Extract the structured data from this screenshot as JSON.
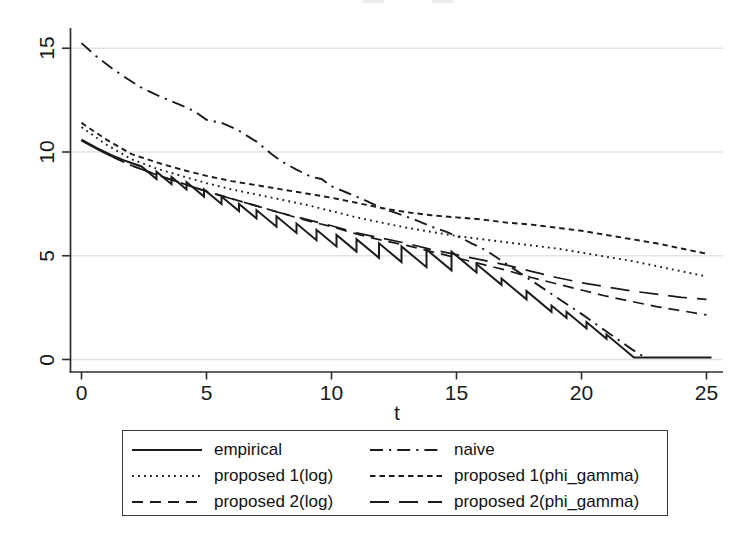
{
  "colors": {
    "line": "#1b1b1b",
    "grid": "#e3e3e3",
    "axis": "#2e2e2e",
    "text": "#1a1a1a",
    "legend_border": "#3a3a3a",
    "background": "#ffffff"
  },
  "chart_data": {
    "type": "line",
    "title": "",
    "xlabel": "t",
    "ylabel": "",
    "xlim": [
      0,
      25.2
    ],
    "ylim": [
      0,
      15.5
    ],
    "x_ticks": [
      0,
      5,
      10,
      15,
      20,
      25
    ],
    "y_ticks": [
      0,
      5,
      10,
      15
    ],
    "grid": "horizontal-only",
    "series": [
      {
        "id": "empirical",
        "name": "empirical",
        "style": "solid",
        "points": [
          [
            0,
            10.6
          ],
          [
            0.6,
            10.2
          ],
          [
            1.2,
            9.85
          ],
          [
            1.8,
            9.55
          ],
          [
            2.4,
            9.3
          ],
          [
            3.0,
            8.7
          ],
          [
            3.0,
            9.05
          ],
          [
            3.6,
            8.45
          ],
          [
            3.6,
            8.8
          ],
          [
            4.2,
            8.2
          ],
          [
            4.2,
            8.55
          ],
          [
            4.9,
            7.85
          ],
          [
            4.9,
            8.2
          ],
          [
            5.6,
            7.5
          ],
          [
            5.6,
            7.85
          ],
          [
            6.3,
            7.15
          ],
          [
            6.3,
            7.5
          ],
          [
            7.0,
            6.8
          ],
          [
            7.0,
            7.2
          ],
          [
            7.8,
            6.4
          ],
          [
            7.8,
            6.9
          ],
          [
            8.6,
            6.1
          ],
          [
            8.6,
            6.55
          ],
          [
            9.4,
            5.75
          ],
          [
            9.4,
            6.25
          ],
          [
            10.2,
            5.45
          ],
          [
            10.2,
            6.0
          ],
          [
            11.0,
            5.2
          ],
          [
            11.0,
            5.8
          ],
          [
            11.9,
            4.9
          ],
          [
            11.9,
            5.6
          ],
          [
            12.8,
            4.7
          ],
          [
            12.8,
            5.45
          ],
          [
            13.8,
            4.45
          ],
          [
            13.8,
            5.3
          ],
          [
            14.8,
            4.3
          ],
          [
            14.8,
            5.2
          ],
          [
            15.8,
            4.2
          ],
          [
            15.8,
            4.6
          ],
          [
            16.8,
            3.6
          ],
          [
            16.8,
            3.9
          ],
          [
            17.8,
            2.9
          ],
          [
            17.8,
            3.3
          ],
          [
            18.8,
            2.3
          ],
          [
            18.8,
            2.6
          ],
          [
            19.4,
            2.0
          ],
          [
            19.4,
            2.3
          ],
          [
            20.2,
            1.5
          ],
          [
            20.2,
            1.8
          ],
          [
            21.0,
            1.0
          ],
          [
            21.0,
            1.2
          ],
          [
            22.1,
            0.1
          ],
          [
            25.2,
            0.1
          ]
        ]
      },
      {
        "id": "naive",
        "name": "naive",
        "style": "dash-dot",
        "points": [
          [
            0,
            15.25
          ],
          [
            0.6,
            14.6
          ],
          [
            1.2,
            14.05
          ],
          [
            1.8,
            13.55
          ],
          [
            2.4,
            13.1
          ],
          [
            3,
            12.75
          ],
          [
            3.6,
            12.45
          ],
          [
            4.2,
            12.15
          ],
          [
            4.6,
            11.9
          ],
          [
            5,
            11.55
          ],
          [
            5.6,
            11.4
          ],
          [
            6.2,
            11.1
          ],
          [
            7,
            10.5
          ],
          [
            7.6,
            9.9
          ],
          [
            8,
            9.55
          ],
          [
            8.6,
            9.15
          ],
          [
            9.2,
            8.8
          ],
          [
            9.6,
            8.7
          ],
          [
            10,
            8.35
          ],
          [
            10.6,
            8.05
          ],
          [
            11.2,
            7.75
          ],
          [
            12,
            7.3
          ],
          [
            12.6,
            7.05
          ],
          [
            13.2,
            6.8
          ],
          [
            14,
            6.4
          ],
          [
            14.6,
            6.15
          ],
          [
            15.2,
            5.85
          ],
          [
            15.6,
            5.6
          ],
          [
            16.2,
            5.25
          ],
          [
            17,
            4.6
          ],
          [
            18,
            3.8
          ],
          [
            19,
            3.0
          ],
          [
            20,
            2.2
          ],
          [
            21,
            1.35
          ],
          [
            22,
            0.5
          ],
          [
            22.6,
            0.05
          ]
        ]
      },
      {
        "id": "proposed-1-log",
        "name": "proposed 1(log)",
        "style": "dotted",
        "points": [
          [
            0,
            11.2
          ],
          [
            1,
            10.35
          ],
          [
            2,
            9.65
          ],
          [
            3,
            9.2
          ],
          [
            4,
            8.85
          ],
          [
            5,
            8.5
          ],
          [
            6,
            8.2
          ],
          [
            7,
            7.95
          ],
          [
            8,
            7.7
          ],
          [
            9,
            7.45
          ],
          [
            10,
            7.15
          ],
          [
            11,
            6.85
          ],
          [
            12,
            6.6
          ],
          [
            13,
            6.35
          ],
          [
            14,
            6.15
          ],
          [
            15,
            5.95
          ],
          [
            16,
            5.8
          ],
          [
            17,
            5.65
          ],
          [
            18,
            5.5
          ],
          [
            19,
            5.35
          ],
          [
            20,
            5.15
          ],
          [
            21,
            4.95
          ],
          [
            22,
            4.75
          ],
          [
            23,
            4.5
          ],
          [
            24,
            4.25
          ],
          [
            25,
            4.0
          ]
        ]
      },
      {
        "id": "proposed-1-phi-gamma",
        "name": "proposed 1(phi_gamma)",
        "style": "short-dash",
        "points": [
          [
            0,
            11.4
          ],
          [
            1,
            10.6
          ],
          [
            2,
            9.9
          ],
          [
            3,
            9.5
          ],
          [
            4,
            9.15
          ],
          [
            5,
            8.85
          ],
          [
            6,
            8.6
          ],
          [
            7,
            8.4
          ],
          [
            8,
            8.2
          ],
          [
            9,
            8.0
          ],
          [
            10,
            7.8
          ],
          [
            11,
            7.55
          ],
          [
            12,
            7.3
          ],
          [
            13,
            7.1
          ],
          [
            14,
            6.95
          ],
          [
            15,
            6.85
          ],
          [
            16,
            6.75
          ],
          [
            17,
            6.6
          ],
          [
            18,
            6.5
          ],
          [
            19,
            6.35
          ],
          [
            20,
            6.2
          ],
          [
            21,
            6.0
          ],
          [
            22,
            5.8
          ],
          [
            23,
            5.6
          ],
          [
            24,
            5.35
          ],
          [
            25,
            5.1
          ]
        ]
      },
      {
        "id": "proposed-2-log",
        "name": "proposed 2(log)",
        "style": "medium-dash",
        "points": [
          [
            0,
            10.55
          ],
          [
            1,
            9.9
          ],
          [
            2,
            9.35
          ],
          [
            3,
            8.9
          ],
          [
            4,
            8.5
          ],
          [
            5,
            8.1
          ],
          [
            6,
            7.75
          ],
          [
            7,
            7.4
          ],
          [
            8,
            7.05
          ],
          [
            9,
            6.7
          ],
          [
            10,
            6.4
          ],
          [
            11,
            6.05
          ],
          [
            12,
            5.75
          ],
          [
            13,
            5.5
          ],
          [
            14,
            5.2
          ],
          [
            15,
            4.9
          ],
          [
            16,
            4.6
          ],
          [
            17,
            4.3
          ],
          [
            18,
            3.95
          ],
          [
            19,
            3.65
          ],
          [
            20,
            3.35
          ],
          [
            21,
            3.05
          ],
          [
            22,
            2.8
          ],
          [
            23,
            2.55
          ],
          [
            24,
            2.35
          ],
          [
            25,
            2.15
          ]
        ]
      },
      {
        "id": "proposed-2-phi-gamma",
        "name": "proposed 2(phi_gamma)",
        "style": "long-dash",
        "points": [
          [
            0,
            10.55
          ],
          [
            1,
            9.9
          ],
          [
            2,
            9.35
          ],
          [
            3,
            8.9
          ],
          [
            4,
            8.5
          ],
          [
            5,
            8.1
          ],
          [
            6,
            7.75
          ],
          [
            7,
            7.4
          ],
          [
            8,
            7.05
          ],
          [
            9,
            6.75
          ],
          [
            10,
            6.45
          ],
          [
            11,
            6.1
          ],
          [
            12,
            5.85
          ],
          [
            13,
            5.6
          ],
          [
            14,
            5.3
          ],
          [
            15,
            5.05
          ],
          [
            16,
            4.8
          ],
          [
            17,
            4.55
          ],
          [
            18,
            4.25
          ],
          [
            19,
            3.95
          ],
          [
            20,
            3.7
          ],
          [
            21,
            3.5
          ],
          [
            22,
            3.3
          ],
          [
            23,
            3.15
          ],
          [
            24,
            3.0
          ],
          [
            25,
            2.9
          ]
        ]
      }
    ],
    "legend": {
      "position": "bottom",
      "columns": 2,
      "order": [
        "empirical",
        "naive",
        "proposed-1-log",
        "proposed-1-phi-gamma",
        "proposed-2-log",
        "proposed-2-phi-gamma"
      ]
    }
  }
}
